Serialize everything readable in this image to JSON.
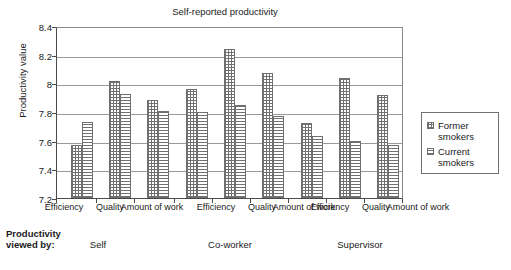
{
  "chart_data": {
    "type": "bar",
    "title": "Self-reported productivity",
    "xlabel": "",
    "ylabel": "Productivity value",
    "ylim": [
      7.2,
      8.4
    ],
    "yticks": [
      "8.4",
      "8.2",
      "8",
      "7.8",
      "7.6",
      "7.4",
      "7.2"
    ],
    "ytick_values": [
      8.4,
      8.2,
      8.0,
      7.8,
      7.6,
      7.4,
      7.2
    ],
    "grid": true,
    "legend_position": "right",
    "categories": [
      "Efficiency",
      "Quality",
      "Amount of work",
      "Efficiency",
      "Quality",
      "Amount of work",
      "Efficiency",
      "Quality",
      "Amount of work"
    ],
    "groups": [
      "Self",
      "Co-worker",
      "Supervisor"
    ],
    "group_axis_label": "Productivity viewed by:",
    "series": [
      {
        "name": "Former smokers",
        "pattern": "crosshatch",
        "values": [
          7.575,
          8.025,
          7.895,
          7.97,
          8.255,
          8.085,
          7.73,
          8.045,
          7.93
        ]
      },
      {
        "name": "Current smokers",
        "pattern": "horizontal-lines",
        "values": [
          7.74,
          7.935,
          7.815,
          7.81,
          7.86,
          7.78,
          7.635,
          7.6,
          7.575
        ]
      }
    ]
  },
  "axis": {
    "y_title": "Productivity value",
    "tick_labels": [
      "8.4",
      "8.2",
      "8",
      "7.8",
      "7.6",
      "7.4",
      "7.2"
    ]
  },
  "categories": {
    "c0": "Efficiency",
    "c1": "Quality",
    "c2": "Amount\nof work",
    "c3": "Efficiency",
    "c4": "Quality",
    "c5": "Amount\nof work",
    "c6": "Efficiency",
    "c7": "Quality",
    "c8": "Amount\nof work"
  },
  "group_row": {
    "viewed_by_label": "Productivity\nviewed by:",
    "g0": "Self",
    "g1": "Co-worker",
    "g2": "Supervisor"
  },
  "legend": {
    "item0": "Former\nsmokers",
    "item1": "Current\nsmokers"
  },
  "caption": {
    "text": ""
  },
  "colors": {
    "pattern_ink": "#707070",
    "axis": "#4a4a4a",
    "gridline": "#9a9a9a",
    "text": "#1a1a1a"
  }
}
